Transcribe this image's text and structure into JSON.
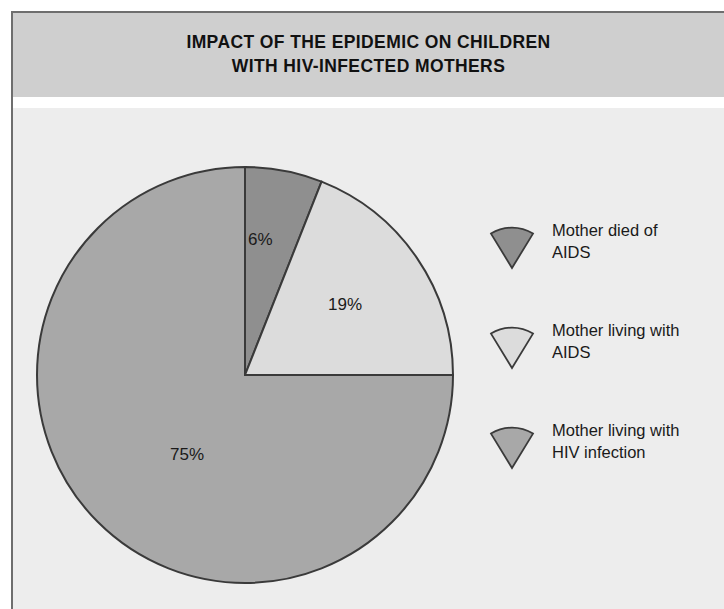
{
  "header": {
    "title_line1": "IMPACT OF THE EPIDEMIC ON CHILDREN",
    "title_line2": "WITH HIV-INFECTED MOTHERS"
  },
  "labels": {
    "slice_died_aids": "6%",
    "slice_living_aids": "19%",
    "slice_living_hiv": "75%"
  },
  "legend": {
    "items": [
      {
        "line1": "Mother died of",
        "line2": "AIDS",
        "color": "#8f8f8f"
      },
      {
        "line1": "Mother living with",
        "line2": "AIDS",
        "color": "#dcdcdc"
      },
      {
        "line1": "Mother living with",
        "line2": "HIV infection",
        "color": "#a8a8a8"
      }
    ]
  },
  "chart_data": {
    "type": "pie",
    "title": "IMPACT OF THE EPIDEMIC ON CHILDREN WITH HIV-INFECTED MOTHERS",
    "xlabel": "",
    "ylabel": "",
    "categories": [
      "Mother died of AIDS",
      "Mother living with AIDS",
      "Mother living with HIV infection"
    ],
    "values": [
      6,
      19,
      75
    ],
    "value_labels": [
      "6%",
      "19%",
      "75%"
    ],
    "units": "percent",
    "colors": [
      "#8f8f8f",
      "#dcdcdc",
      "#a8a8a8"
    ],
    "start_angle_deg": 0,
    "direction": "clockwise",
    "legend_position": "right",
    "grid": false,
    "outline_color": "#3a3a3a",
    "background": "#ededed",
    "header_background": "#cfcfcf"
  }
}
